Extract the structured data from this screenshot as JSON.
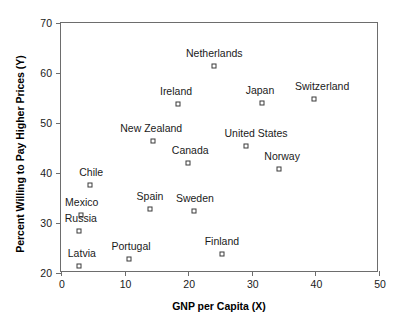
{
  "chart_data": {
    "type": "scatter",
    "title": "",
    "xlabel": "GNP per Capita (X)",
    "ylabel": "Percent Willing to Pay Higher Prices (Y)",
    "xlim": [
      0,
      50
    ],
    "ylim": [
      20,
      70
    ],
    "xticks": [
      "0",
      "10",
      "20",
      "30",
      "40",
      "50"
    ],
    "yticks": [
      "20",
      "30",
      "40",
      "50",
      "60",
      "70"
    ],
    "xtick_values": [
      0,
      10,
      20,
      30,
      40,
      50
    ],
    "ytick_values": [
      20,
      30,
      40,
      50,
      60,
      70
    ],
    "grid": false,
    "legend": "none",
    "marker": "open-square",
    "marker_color": "#3a3a3a",
    "points": [
      {
        "label": "Netherlands",
        "x": 24.1,
        "y": 61.4
      },
      {
        "label": "Switzerland",
        "x": 39.8,
        "y": 54.8
      },
      {
        "label": "Japan",
        "x": 31.6,
        "y": 54.0
      },
      {
        "label": "Ireland",
        "x": 18.4,
        "y": 53.8
      },
      {
        "label": "New Zealand",
        "x": 14.5,
        "y": 46.4
      },
      {
        "label": "United States",
        "x": 29.1,
        "y": 45.4
      },
      {
        "label": "Canada",
        "x": 20.0,
        "y": 42.0
      },
      {
        "label": "Norway",
        "x": 34.3,
        "y": 40.8
      },
      {
        "label": "Chile",
        "x": 4.6,
        "y": 37.6
      },
      {
        "label": "Spain",
        "x": 14.0,
        "y": 32.8
      },
      {
        "label": "Sweden",
        "x": 20.9,
        "y": 32.5
      },
      {
        "label": "Mexico",
        "x": 3.1,
        "y": 31.6
      },
      {
        "label": "Russia",
        "x": 2.8,
        "y": 28.4
      },
      {
        "label": "Finland",
        "x": 25.3,
        "y": 23.9
      },
      {
        "label": "Portugal",
        "x": 10.7,
        "y": 22.9
      },
      {
        "label": "Latvia",
        "x": 2.8,
        "y": 21.4
      }
    ],
    "label_offsets": {
      "Netherlands": {
        "dx": 0,
        "dy": -7
      },
      "Switzerland": {
        "dx": 8,
        "dy": -7
      },
      "Japan": {
        "dx": -2,
        "dy": -7
      },
      "Ireland": {
        "dx": -2,
        "dy": -7
      },
      "New Zealand": {
        "dx": -2,
        "dy": -7
      },
      "United States": {
        "dx": 10,
        "dy": -7
      },
      "Canada": {
        "dx": 2,
        "dy": -7
      },
      "Norway": {
        "dx": 3,
        "dy": -7
      },
      "Chile": {
        "dx": 1,
        "dy": -7
      },
      "Spain": {
        "dx": 0,
        "dy": -7
      },
      "Sweden": {
        "dx": 1,
        "dy": -7
      },
      "Mexico": {
        "dx": 1,
        "dy": -7
      },
      "Russia": {
        "dx": 2,
        "dy": -7
      },
      "Finland": {
        "dx": 0,
        "dy": -7
      },
      "Portugal": {
        "dx": 2,
        "dy": -7
      },
      "Latvia": {
        "dx": 3,
        "dy": -7
      }
    }
  }
}
